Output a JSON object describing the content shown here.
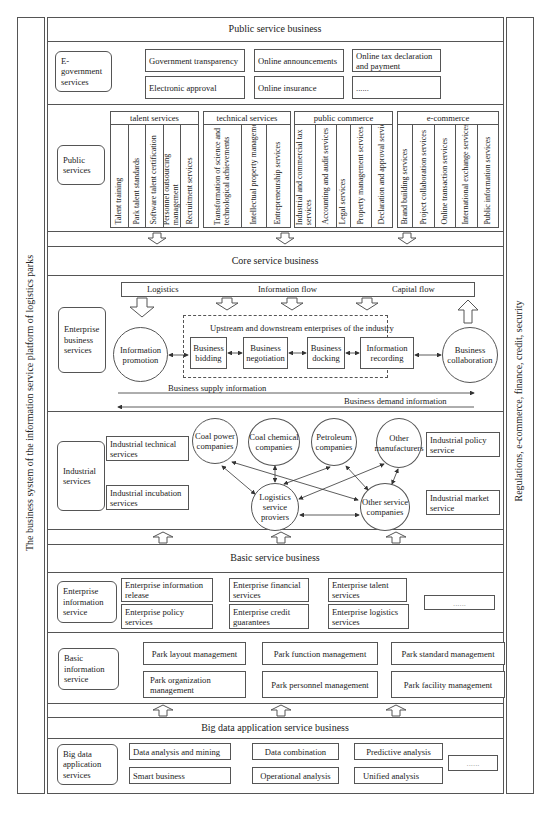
{
  "side_panels": {
    "left": "The business system of the information service platform of logistics parks",
    "right": "Regulations, e-commerce, finance, credit, security"
  },
  "public_service": {
    "title": "Public service business",
    "egov": {
      "label": "E-government services",
      "items": [
        "Government transparency",
        "Online announcements",
        "Online tax declaration and payment",
        "Electronic approval",
        "Online insurance",
        "......"
      ]
    },
    "public_services": {
      "label": "Public services",
      "categories": [
        {
          "name": "talent services",
          "items": [
            "Talent training",
            "Park talent standards",
            "Software talent certification",
            "Personnel outsourcing management",
            "Recruitment services"
          ]
        },
        {
          "name": "technical services",
          "items": [
            "Transformation of science and technological achievements",
            "Intellectual property management",
            "Entrepreneurship services"
          ]
        },
        {
          "name": "public commerce",
          "items": [
            "Industrial and commercial tax services",
            "Accounting and audit services",
            "Legal services",
            "Property management services",
            "Declaration and approval services"
          ]
        },
        {
          "name": "e-commerce",
          "items": [
            "Brand building services",
            "Project collaboration services",
            "Online transaction services",
            "International exchange services",
            "Public information services"
          ]
        }
      ]
    }
  },
  "core_service": {
    "title": "Core service business",
    "enterprise": {
      "label": "Enterprise business services",
      "flows": [
        "Logistics",
        "Information flow",
        "Capital flow"
      ],
      "industry_label": "Upstream and downstream enterprises of the industry",
      "left_node": "Information promotion",
      "right_node": "Business collaboration",
      "steps": [
        "Business bidding",
        "Business negotiation",
        "Business docking",
        "Information recording"
      ],
      "supply": "Business supply information",
      "demand": "Business demand information"
    },
    "industrial": {
      "label": "Industrial services",
      "left_items": [
        "Industrial technical services",
        "Industrial incubation services"
      ],
      "right_items": [
        "Industrial policy service",
        "Industrial market service"
      ],
      "top_nodes": [
        "Coal power companies",
        "Coal chemical companies",
        "Petroleum companies",
        "Other manufacturers"
      ],
      "bottom_nodes": [
        "Logistics service proviers",
        "Other service companies"
      ]
    }
  },
  "basic_service": {
    "title": "Basic service business",
    "enterprise_info": {
      "label": "Enterprise information service",
      "items": [
        "Enterprise information release",
        "Enterprise financial services",
        "Enterprise talent services",
        "Enterprise policy services",
        "Enterprise credit guarantees",
        "Enterprise logistics services",
        "......"
      ]
    },
    "basic_info": {
      "label": "Basic information service",
      "items": [
        "Park layout management",
        "Park function management",
        "Park standard management",
        "Park organization management",
        "Park personnel management",
        "Park facility management"
      ]
    }
  },
  "big_data": {
    "title": "Big data application service business",
    "label": "Big data application services",
    "items": [
      "Data analysis and mining",
      "Data combination",
      "Predictive analysis",
      "Smart business",
      "Operational analysis",
      "Unified analysis",
      "......"
    ]
  }
}
